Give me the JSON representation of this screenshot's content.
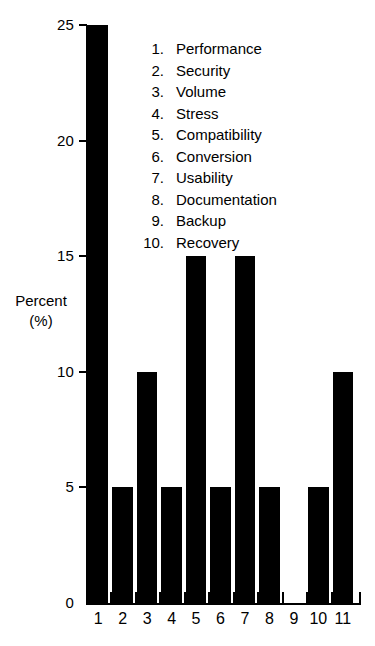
{
  "chart_data": {
    "type": "bar",
    "title": "",
    "xlabel": "",
    "ylabel": "Percent (%)",
    "ylabel_lines": [
      "Percent",
      "(%)"
    ],
    "categories": [
      "1",
      "2",
      "3",
      "4",
      "5",
      "6",
      "7",
      "8",
      "9",
      "10",
      "11"
    ],
    "values": [
      25,
      5,
      10,
      5,
      15,
      5,
      15,
      5,
      0,
      5,
      10
    ],
    "ylim": [
      0,
      25
    ],
    "yticks": [
      0,
      5,
      10,
      15,
      20,
      25
    ],
    "ytick_labels": [
      "0",
      "5",
      "10",
      "15",
      "20",
      "25"
    ],
    "grid": false,
    "legend_position": "inside-top-right",
    "bar_color": "#000000",
    "background_color": "#FFFFFF",
    "legend": [
      {
        "number": "1.",
        "label": "Performance"
      },
      {
        "number": "2.",
        "label": "Security"
      },
      {
        "number": "3.",
        "label": "Volume"
      },
      {
        "number": "4.",
        "label": "Stress"
      },
      {
        "number": "5.",
        "label": "Compatibility"
      },
      {
        "number": "6.",
        "label": "Conversion"
      },
      {
        "number": "7.",
        "label": "Usability"
      },
      {
        "number": "8.",
        "label": "Documentation"
      },
      {
        "number": "9.",
        "label": "Backup"
      },
      {
        "number": "10.",
        "label": "Recovery"
      }
    ]
  }
}
